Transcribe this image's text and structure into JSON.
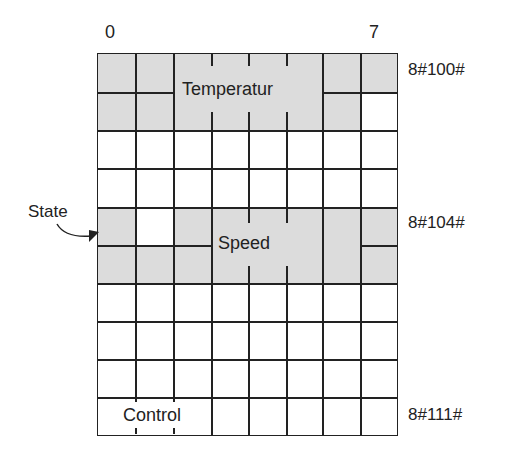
{
  "bit_labels": {
    "left": "0",
    "right": "7"
  },
  "fields": {
    "temperature": "Temperatur",
    "speed": "Speed",
    "control": "Control"
  },
  "state_label": "State",
  "addresses": {
    "temp": "8#100#",
    "speed": "8#104#",
    "control": "8#111#"
  },
  "colors": {
    "shade": "#dcdcdc",
    "line": "#222222"
  }
}
